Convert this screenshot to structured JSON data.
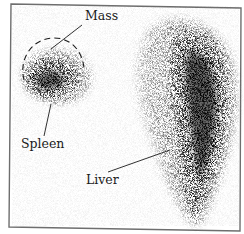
{
  "figure": {
    "type": "nuclear-medicine-scintigraphy",
    "labels": {
      "mass": "Mass",
      "spleen": "Spleen",
      "liver": "Liver"
    },
    "colors": {
      "background": "#ffffff",
      "uptake": "#0a0a0a",
      "frame": "#6e6e6e",
      "annotation": "#1a1a1a"
    }
  }
}
